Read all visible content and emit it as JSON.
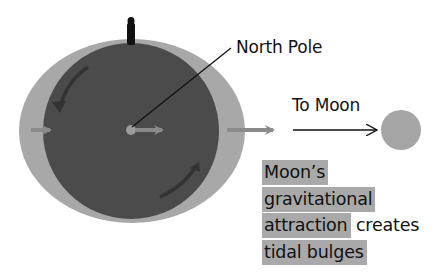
{
  "diagram": {
    "type": "tidal-bulge-illustration",
    "labels": {
      "north_pole": "North Pole",
      "to_moon": "To Moon"
    },
    "caption": {
      "lines": [
        {
          "highlighted": "Moon’s",
          "plain": ""
        },
        {
          "highlighted": "gravitational",
          "plain": ""
        },
        {
          "highlighted": "attraction",
          "plain": " creates"
        },
        {
          "highlighted": "tidal bulges",
          "plain": ""
        }
      ]
    },
    "colors": {
      "earth": "#4b4b4b",
      "tidal_bulge": "#a8a8a8",
      "moon": "#a5a5a5",
      "arrow_gray": "#8a8a8a",
      "text": "#111111",
      "highlight": "#a9a9a9"
    },
    "elements": {
      "earth": {
        "cx": 131,
        "cy": 131,
        "r": 88
      },
      "bulge": {
        "cx": 132,
        "cy": 131,
        "rx": 113,
        "ry": 92
      },
      "moon": {
        "cx": 401,
        "cy": 130,
        "r": 20
      },
      "observer_figure": {
        "x": 130,
        "y": 16
      }
    }
  }
}
